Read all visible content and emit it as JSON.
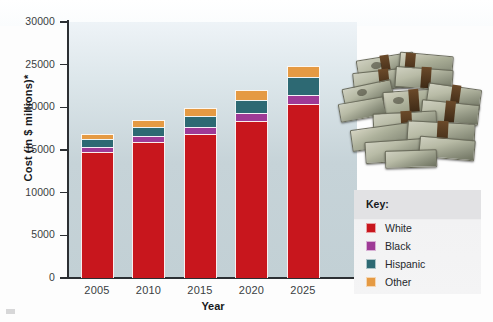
{
  "figure": {
    "kind": "stacked-bar-chart-with-photo",
    "y_axis_title": "Cost (in $ millions)*",
    "x_axis_title": "Year",
    "legend_title": "Key:",
    "photo_caption": "stack-of-banded-cash-bundles"
  },
  "chart_data": {
    "type": "bar",
    "stacked": true,
    "title": "",
    "xlabel": "Year",
    "ylabel": "Cost (in $ millions)*",
    "categories": [
      "2005",
      "2010",
      "2015",
      "2020",
      "2025"
    ],
    "ylim": [
      0,
      30000
    ],
    "yticks": [
      0,
      5000,
      10000,
      15000,
      20000,
      25000,
      30000
    ],
    "ytick_labels": [
      "0",
      "5000",
      "10000",
      "15000",
      "20000",
      "25000",
      "30000"
    ],
    "grid": false,
    "legend_position": "right-outside",
    "series": [
      {
        "name": "White",
        "color": "#c8161d",
        "values": [
          14800,
          15900,
          16900,
          18400,
          20400
        ]
      },
      {
        "name": "Black",
        "color": "#9e3a96",
        "values": [
          600,
          700,
          800,
          900,
          1100
        ]
      },
      {
        "name": "Hispanic",
        "color": "#2d6973",
        "values": [
          900,
          1100,
          1300,
          1600,
          2000
        ]
      },
      {
        "name": "Other",
        "color": "#e59a43",
        "values": [
          600,
          800,
          900,
          1100,
          1400
        ]
      }
    ],
    "totals": [
      16900,
      18500,
      19900,
      22000,
      24900
    ]
  },
  "y_ticks": [
    {
      "label": "30000",
      "value": 30000
    },
    {
      "label": "25000",
      "value": 25000
    },
    {
      "label": "20000",
      "value": 20000
    },
    {
      "label": "15000",
      "value": 15000
    },
    {
      "label": "10000",
      "value": 10000
    },
    {
      "label": "5000",
      "value": 5000
    },
    {
      "label": "0",
      "value": 0
    }
  ],
  "legend": {
    "title": "Key:",
    "items": [
      {
        "label": "White",
        "color": "#c8161d"
      },
      {
        "label": "Black",
        "color": "#9e3a96"
      },
      {
        "label": "Hispanic",
        "color": "#2d6973"
      },
      {
        "label": "Other",
        "color": "#e59a43"
      }
    ]
  },
  "colors": {
    "plot_background_top": "#eef3f7",
    "plot_background_bottom": "#c2d0d5",
    "axis": "#2c2f33",
    "legend_background": "#f3f3f4",
    "legend_header_background": "#e2e2e4",
    "page_background": "#fdfdfd"
  }
}
